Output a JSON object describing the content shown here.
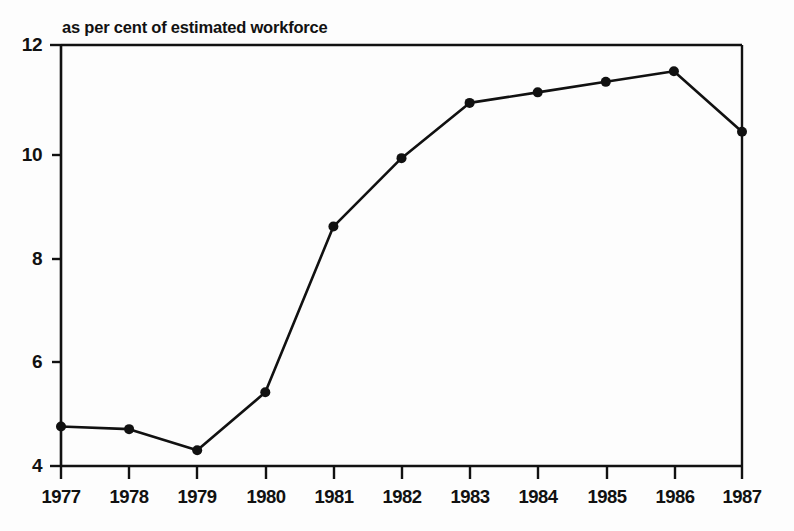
{
  "chart_data": {
    "type": "line",
    "title": "as per cent of estimated workforce",
    "xlabel": "",
    "ylabel": "",
    "categories": [
      "1977",
      "1978",
      "1979",
      "1980",
      "1981",
      "1982",
      "1983",
      "1984",
      "1985",
      "1986",
      "1987"
    ],
    "x": [
      1977,
      1978,
      1979,
      1980,
      1981,
      1982,
      1983,
      1984,
      1985,
      1986,
      1987
    ],
    "values": [
      4.75,
      4.7,
      4.3,
      5.4,
      8.55,
      9.85,
      10.9,
      11.1,
      11.3,
      11.5,
      10.35
    ],
    "series": [
      {
        "name": "as per cent of estimated workforce",
        "values": [
          4.75,
          4.7,
          4.3,
          5.4,
          8.55,
          9.85,
          10.9,
          11.1,
          11.3,
          11.5,
          10.35
        ]
      }
    ],
    "ylim": [
      4,
      12
    ],
    "xlim": [
      1977,
      1987
    ],
    "yticks": [
      4,
      6,
      8,
      10,
      12
    ],
    "ytick_labels": [
      "4",
      "6",
      "8",
      "10",
      "12"
    ],
    "xtick_labels": [
      "1977",
      "1978",
      "1979",
      "1980",
      "1981",
      "1982",
      "1983",
      "1984",
      "1985",
      "1986",
      "1987"
    ],
    "grid": false,
    "legend": null,
    "legend_position": "none",
    "marker": "filled-circle",
    "line_color": "#111111",
    "marker_color": "#111111",
    "axis_color": "#111111",
    "background_color": "#fdfdfd"
  },
  "axis": {
    "y_labels": [
      "12",
      "10",
      "8",
      "6",
      "4"
    ],
    "x_labels": [
      "1977",
      "1978",
      "1979",
      "1980",
      "1981",
      "1982",
      "1983",
      "1984",
      "1985",
      "1986",
      "1987"
    ]
  }
}
